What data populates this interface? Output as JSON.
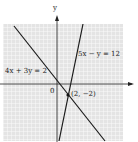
{
  "graph": {
    "axes": {
      "x_label": "",
      "y_label": "y",
      "origin_label": "0"
    },
    "lines": [
      {
        "equation": "5x − y = 12"
      },
      {
        "equation": "4x + 3y = 2"
      }
    ],
    "intersection": {
      "label": "(2, −2)",
      "x": 2,
      "y": -2
    },
    "colors": {
      "grid_bg": "#e6e6e6",
      "grid_line": "#ffffff",
      "line": "#1a1a1a"
    }
  }
}
